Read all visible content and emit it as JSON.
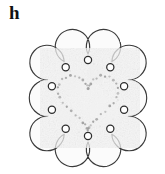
{
  "panel": {
    "label": "h",
    "width": 165,
    "height": 174,
    "background_color": "#ffffff"
  },
  "specimen": {
    "name": "flower-shaped-paper-doily",
    "description": "Scalloped flower-shaped translucent paper sheet with round punched holes on each petal and a dotted heart-shaped perforation pattern in the centre",
    "outline_color": "#3a3a3a",
    "fill_color": "#fafafa",
    "texture_color": "#e8e8e8",
    "hole_stroke_color": "#2e2e2e",
    "dot_color": "#9a9a9a",
    "center": {
      "x": 88,
      "y": 98
    },
    "petal_count": 10,
    "body_radius": 44,
    "petal_radius": 17,
    "hole_radius": 3.6,
    "hole_ring_radius": 38,
    "petals": [
      {
        "index": 1,
        "angle_deg": -90,
        "hole_x": 88.0,
        "hole_y": 60.0
      },
      {
        "index": 2,
        "angle_deg": -54,
        "hole_x": 110.3,
        "hole_y": 67.2
      },
      {
        "index": 3,
        "angle_deg": -18,
        "hole_x": 124.1,
        "hole_y": 86.3
      },
      {
        "index": 4,
        "angle_deg": 18,
        "hole_x": 124.1,
        "hole_y": 109.7
      },
      {
        "index": 5,
        "angle_deg": 54,
        "hole_x": 110.3,
        "hole_y": 128.8
      },
      {
        "index": 6,
        "angle_deg": 90,
        "hole_x": 88.0,
        "hole_y": 136.0
      },
      {
        "index": 7,
        "angle_deg": 126,
        "hole_x": 65.7,
        "hole_y": 128.8
      },
      {
        "index": 8,
        "angle_deg": 162,
        "hole_x": 51.9,
        "hole_y": 109.7
      },
      {
        "index": 9,
        "angle_deg": 198,
        "hole_x": 51.9,
        "hole_y": 86.3
      },
      {
        "index": 10,
        "angle_deg": 234,
        "hole_x": 65.7,
        "hole_y": 67.2
      }
    ],
    "heart": {
      "name": "dotted-heart-perforation",
      "dot_count": 46,
      "dot_radius": 1.15,
      "dot_color": "#9a9a9a",
      "center_x": 88,
      "center_y": 98,
      "width": 62,
      "height": 54
    }
  },
  "chart_data": {
    "type": "scatter",
    "title": "h",
    "xlabel": "",
    "ylabel": "",
    "series": [
      {
        "name": "petal-holes",
        "values": [
          [
            88.0,
            60.0
          ],
          [
            110.3,
            67.2
          ],
          [
            124.1,
            86.3
          ],
          [
            124.1,
            109.7
          ],
          [
            110.3,
            128.8
          ],
          [
            88.0,
            136.0
          ],
          [
            65.7,
            128.8
          ],
          [
            51.9,
            109.7
          ],
          [
            51.9,
            86.3
          ],
          [
            65.7,
            67.2
          ]
        ]
      }
    ],
    "annotations": [
      "h"
    ]
  }
}
